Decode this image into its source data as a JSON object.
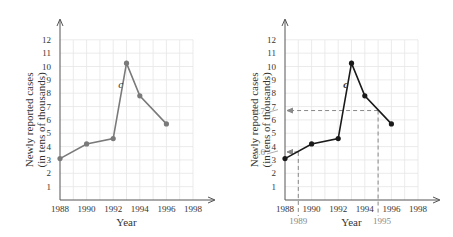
{
  "chart_data": [
    {
      "type": "line",
      "title": "",
      "xlabel": "Year",
      "ylabel": "Newly reported cases (in tens of thousands)",
      "x": [
        1988,
        1990,
        1992,
        1993,
        1994,
        1996
      ],
      "values": [
        3.1,
        4.2,
        4.6,
        10.25,
        7.8,
        5.7
      ],
      "curve_label": "c",
      "xticks": [
        "1988",
        "1990",
        "1992",
        "1994",
        "1996",
        "1998"
      ],
      "yticks": [
        "1",
        "2",
        "3",
        "4",
        "5",
        "6",
        "7",
        "8",
        "9",
        "10",
        "11",
        "12"
      ],
      "xlim": [
        1988,
        1998
      ],
      "ylim": [
        0,
        12
      ],
      "grid": true,
      "line_color": "#7a7a7a"
    },
    {
      "type": "line",
      "title": "",
      "xlabel": "Year",
      "ylabel": "Newly reported cases (in tens of thousands)",
      "x": [
        1988,
        1990,
        1992,
        1993,
        1994,
        1996
      ],
      "values": [
        3.1,
        4.2,
        4.6,
        10.25,
        7.8,
        5.7
      ],
      "curve_label": "c",
      "xticks": [
        "1988",
        "1990",
        "1992",
        "1994",
        "1996",
        "1998"
      ],
      "yticks": [
        "1",
        "2",
        "3",
        "4",
        "5",
        "6",
        "7",
        "8",
        "9",
        "10",
        "11",
        "12"
      ],
      "xlim": [
        1988,
        1998
      ],
      "ylim": [
        0,
        12
      ],
      "grid": true,
      "line_color": "#1a1a1a",
      "annotations": [
        {
          "x": 1989,
          "y": 3.6,
          "x_label": "1989",
          "y_label": "3.6"
        },
        {
          "x": 1995,
          "y": 6.7,
          "x_label": "1995",
          "y_label": "6.7"
        }
      ]
    }
  ],
  "left": {
    "xlabel": "Year",
    "ylabel1": "Newly reported cases",
    "ylabel2": "(in tens of thousands)",
    "curve": "c"
  },
  "right": {
    "xlabel": "Year",
    "ylabel1": "Newly reported cases",
    "ylabel2": "(in tens of thousands)",
    "curve": "c",
    "ann1989": "1989",
    "ann1995": "1995",
    "ann36": "3.6",
    "ann67": "6.7"
  }
}
